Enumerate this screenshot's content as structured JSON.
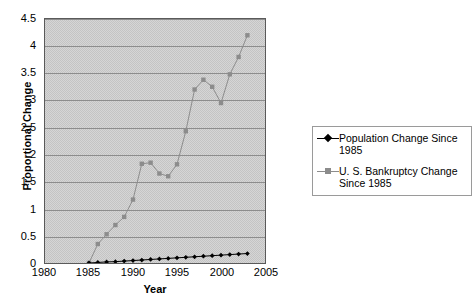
{
  "chart_data": {
    "type": "line",
    "title": "",
    "xlabel": "Year",
    "ylabel": "Proportional Change",
    "xlim": [
      1980,
      2005
    ],
    "ylim": [
      0,
      4.5
    ],
    "xticks": [
      "1980",
      "1985",
      "1990",
      "1995",
      "2000",
      "2005"
    ],
    "yticks": [
      "0",
      "0.5",
      "1",
      "1.5",
      "2",
      "2.5",
      "3",
      "3.5",
      "4",
      "4.5"
    ],
    "grid": "horizontal",
    "legend_position": "right",
    "x": [
      1985,
      1986,
      1987,
      1988,
      1989,
      1990,
      1991,
      1992,
      1993,
      1994,
      1995,
      1996,
      1997,
      1998,
      1999,
      2000,
      2001,
      2002,
      2003
    ],
    "series": [
      {
        "name": "Population Change Since 1985",
        "color": "#000000",
        "marker": "diamond",
        "values": [
          0,
          0.01,
          0.02,
          0.025,
          0.035,
          0.045,
          0.055,
          0.065,
          0.075,
          0.085,
          0.095,
          0.105,
          0.115,
          0.125,
          0.135,
          0.145,
          0.155,
          0.165,
          0.175
        ]
      },
      {
        "name": "U. S. Bankruptcy Change Since 1985",
        "color": "#8c8c8c",
        "marker": "square",
        "values": [
          0,
          0.35,
          0.53,
          0.7,
          0.85,
          1.17,
          1.83,
          1.85,
          1.65,
          1.6,
          1.82,
          2.43,
          3.2,
          3.38,
          3.25,
          2.95,
          3.48,
          3.8,
          4.2
        ]
      }
    ]
  },
  "legend": {
    "entries": [
      {
        "label": "Population Change Since 1985"
      },
      {
        "label": "U. S. Bankruptcy Change\nSince 1985"
      }
    ]
  }
}
